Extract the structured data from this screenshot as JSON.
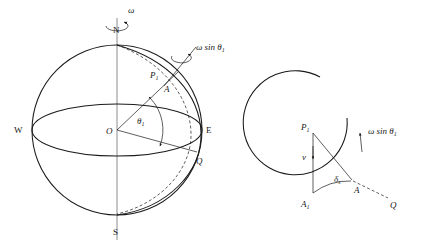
{
  "figure": {
    "left_panel": {
      "name": "sphere-panel",
      "labels": {
        "north_pole": "N",
        "south_pole": "S",
        "west": "W",
        "east": "E",
        "center": "O",
        "point_p1": "P",
        "point_p1_sub": "1",
        "point_a": "A",
        "point_q": "Q",
        "omega": "ω",
        "angle_theta": "θ",
        "angle_theta_sub": "1",
        "omega_sin_theta": "ω sin θ",
        "omega_sin_theta_sub": "1"
      }
    },
    "right_panel": {
      "name": "detail-panel",
      "labels": {
        "point_p1": "P",
        "point_p1_sub": "1",
        "point_a1": "A",
        "point_a1_sub": "1",
        "point_a": "A",
        "point_q": "Q",
        "velocity": "v",
        "delta": "δ",
        "delta_sub": "s",
        "omega_sin_theta": "ω sin θ",
        "omega_sin_theta_sub": "1"
      }
    }
  },
  "colors": {
    "ink": "#1a1a1a",
    "axis_gray": "#8c8c8c",
    "background": "#ffffff"
  }
}
